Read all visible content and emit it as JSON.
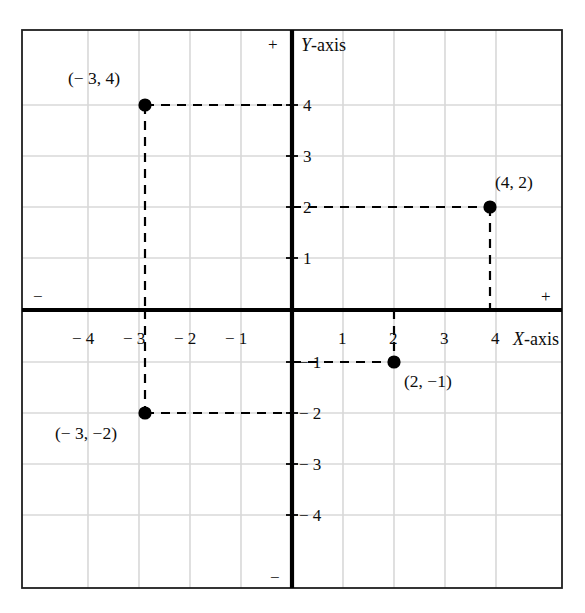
{
  "figure": {
    "kind": "cartesian-coordinate-plane",
    "axis_labels": {
      "x": "X-axis",
      "y": "Y-axis"
    },
    "direction_signs": {
      "y_positive": "+",
      "y_negative": "−",
      "x_positive": "+",
      "x_negative": "−"
    },
    "colors": {
      "axis": "#000000",
      "grid": "#d6d6d6",
      "frame": "#1a1a1a",
      "point": "#000000",
      "dash": "#000000",
      "background": "#ffffff"
    }
  },
  "chart_data": {
    "type": "scatter",
    "title": "",
    "xlabel": "X-axis",
    "ylabel": "Y-axis",
    "xlim": [
      -5.3,
      5.3
    ],
    "ylim": [
      -5.5,
      5.5
    ],
    "grid": true,
    "legend": "none",
    "x_ticks": [
      -4,
      -3,
      -2,
      -1,
      1,
      2,
      3,
      4
    ],
    "x_tick_labels": [
      "− 4",
      "− 3",
      "− 2",
      "− 1",
      "1",
      "2",
      "3",
      "4"
    ],
    "y_ticks": [
      4,
      3,
      2,
      1,
      -1,
      -2,
      -3,
      -4
    ],
    "y_tick_labels": [
      "4",
      "3",
      "2",
      "1",
      "− 1",
      "− 2",
      "− 3",
      "− 4"
    ],
    "points": [
      {
        "x": -3,
        "y": 4,
        "label": "(− 3, 4)",
        "label_position": "above-left",
        "guide_lines": [
          "horizontal-to-y-axis",
          "vertical-to-x-axis"
        ]
      },
      {
        "x": 4,
        "y": 2,
        "label": "(4, 2)",
        "label_position": "above-right",
        "guide_lines": [
          "horizontal-to-y-axis",
          "vertical-to-x-axis"
        ]
      },
      {
        "x": -3,
        "y": -2,
        "label": "(− 3, −2)",
        "label_position": "below-left",
        "guide_lines": [
          "horizontal-to-y-axis",
          "vertical-to-x-axis"
        ]
      },
      {
        "x": 2,
        "y": -1,
        "label": "(2, −1)",
        "label_position": "below-right",
        "guide_lines": [
          "horizontal-to-y-axis",
          "vertical-to-x-axis"
        ]
      }
    ]
  }
}
